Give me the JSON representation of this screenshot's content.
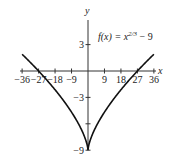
{
  "chart_data": {
    "type": "line",
    "title": "",
    "annotation": "f(x) = x^(2/3) − 9",
    "annotation_parts": {
      "lhs": "f(x) = x",
      "exponent": "2/3",
      "rhs": " − 9"
    },
    "xlabel": "x",
    "ylabel": "y",
    "xlim": [
      -36,
      36
    ],
    "ylim": [
      -9,
      3
    ],
    "x_ticks": [
      -36,
      -27,
      -18,
      -9,
      9,
      18,
      27,
      36
    ],
    "x_tick_labels": [
      "−36",
      "−27",
      "−18",
      "−9",
      "9",
      "18",
      "27",
      "36"
    ],
    "y_ticks": [
      3,
      -3,
      -9
    ],
    "y_tick_labels": [
      "3",
      "−3",
      "−9"
    ],
    "y_minor_ticks": [
      -6
    ],
    "grid": false,
    "series": [
      {
        "name": "f(x) = x^(2/3) − 9",
        "color": "#111111",
        "x": [
          -36,
          -27,
          -18,
          -9,
          -4,
          -1,
          0,
          1,
          4,
          9,
          18,
          27,
          36
        ],
        "y": [
          1.9,
          0.0,
          -2.13,
          -4.67,
          -6.48,
          -8.0,
          -9.0,
          -8.0,
          -6.48,
          -4.67,
          -2.13,
          0.0,
          1.9
        ]
      }
    ]
  }
}
